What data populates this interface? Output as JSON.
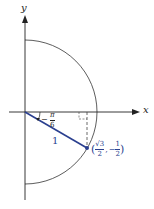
{
  "diagram": {
    "axes": {
      "x_label": "x",
      "y_label": "y"
    },
    "angle": {
      "sign": "−",
      "numerator": "π",
      "denominator": "6"
    },
    "radius_label": "1",
    "point": {
      "open": "(",
      "x_num": "√3",
      "x_den": "2",
      "sep": ",",
      "y_sign": "−",
      "y_num": "1",
      "y_den": "2",
      "close": ")"
    },
    "colors": {
      "radius_line": "#2a3f8f",
      "axis": "#222222",
      "circle": "#333333"
    }
  }
}
